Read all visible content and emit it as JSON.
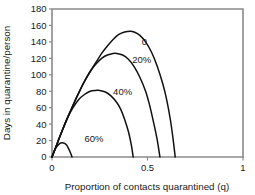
{
  "chart_data": {
    "type": "line",
    "title": "",
    "xlabel": "Proportion of contacts quarantined (q)",
    "ylabel": "Days in quarantine/person",
    "xlim": [
      0,
      1
    ],
    "ylim": [
      0,
      180
    ],
    "xticks": [
      0,
      0.5,
      1
    ],
    "xticklabels": [
      "0",
      "0.5",
      "1"
    ],
    "yticks": [
      0,
      20,
      40,
      60,
      80,
      100,
      120,
      140,
      160,
      180
    ],
    "yticklabels": [
      "0",
      "20",
      "40",
      "60",
      "80",
      "100",
      "120",
      "140",
      "160",
      "180"
    ],
    "grid": false,
    "legend": "inline-curve-labels",
    "curve_color": "#111111",
    "axis_color": "#8a8a8a",
    "series": [
      {
        "name": "0",
        "label": "0",
        "label_x": 0.47,
        "label_y": 140,
        "points": [
          [
            0.0,
            0
          ],
          [
            0.02,
            12
          ],
          [
            0.05,
            30
          ],
          [
            0.08,
            47
          ],
          [
            0.11,
            63
          ],
          [
            0.14,
            78
          ],
          [
            0.17,
            92
          ],
          [
            0.2,
            104
          ],
          [
            0.23,
            115
          ],
          [
            0.26,
            126
          ],
          [
            0.29,
            135
          ],
          [
            0.32,
            143
          ],
          [
            0.35,
            149
          ],
          [
            0.38,
            152
          ],
          [
            0.41,
            153
          ],
          [
            0.43,
            152
          ],
          [
            0.46,
            148
          ],
          [
            0.49,
            140
          ],
          [
            0.52,
            128
          ],
          [
            0.55,
            111
          ],
          [
            0.58,
            89
          ],
          [
            0.6,
            70
          ],
          [
            0.62,
            45
          ],
          [
            0.635,
            20
          ],
          [
            0.645,
            0
          ]
        ]
      },
      {
        "name": "20%",
        "label": "20%",
        "label_x": 0.42,
        "label_y": 118,
        "points": [
          [
            0.0,
            0
          ],
          [
            0.02,
            12
          ],
          [
            0.05,
            30
          ],
          [
            0.08,
            47
          ],
          [
            0.11,
            63
          ],
          [
            0.14,
            78
          ],
          [
            0.17,
            92
          ],
          [
            0.2,
            104
          ],
          [
            0.23,
            113
          ],
          [
            0.26,
            120
          ],
          [
            0.29,
            124
          ],
          [
            0.32,
            126
          ],
          [
            0.34,
            126
          ],
          [
            0.37,
            124
          ],
          [
            0.4,
            119
          ],
          [
            0.43,
            110
          ],
          [
            0.46,
            97
          ],
          [
            0.49,
            80
          ],
          [
            0.51,
            64
          ],
          [
            0.53,
            44
          ],
          [
            0.55,
            22
          ],
          [
            0.565,
            0
          ]
        ]
      },
      {
        "name": "40%",
        "label": "40%",
        "label_x": 0.32,
        "label_y": 80,
        "points": [
          [
            0.0,
            0
          ],
          [
            0.02,
            12
          ],
          [
            0.05,
            30
          ],
          [
            0.08,
            47
          ],
          [
            0.11,
            60
          ],
          [
            0.14,
            70
          ],
          [
            0.17,
            76
          ],
          [
            0.2,
            80
          ],
          [
            0.23,
            81
          ],
          [
            0.25,
            81
          ],
          [
            0.28,
            79
          ],
          [
            0.31,
            74
          ],
          [
            0.34,
            66
          ],
          [
            0.36,
            58
          ],
          [
            0.38,
            46
          ],
          [
            0.4,
            31
          ],
          [
            0.415,
            15
          ],
          [
            0.425,
            0
          ]
        ]
      },
      {
        "name": "60%",
        "label": "60%",
        "label_x": 0.17,
        "label_y": 22,
        "points": [
          [
            0.0,
            0
          ],
          [
            0.015,
            9
          ],
          [
            0.03,
            14
          ],
          [
            0.045,
            17
          ],
          [
            0.06,
            17
          ],
          [
            0.075,
            15
          ],
          [
            0.085,
            11
          ],
          [
            0.095,
            6
          ],
          [
            0.105,
            0
          ]
        ]
      }
    ]
  },
  "layout": {
    "plot_left": 52,
    "plot_right": 243,
    "plot_top": 9,
    "plot_bottom": 157
  }
}
